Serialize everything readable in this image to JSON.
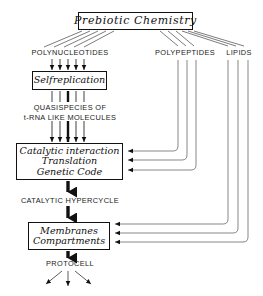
{
  "diagram": {
    "type": "flowchart",
    "boxes": [
      {
        "id": "prebiotic",
        "lines": [
          "Prebiotic  Chemistry"
        ]
      },
      {
        "id": "selfreplication",
        "lines": [
          "Selfreplication"
        ]
      },
      {
        "id": "catalytic",
        "lines": [
          "Catalytic  interaction",
          "Translation",
          "Genetic  Code"
        ]
      },
      {
        "id": "membranes",
        "lines": [
          "Membranes",
          "Compartments"
        ]
      }
    ],
    "captions": {
      "polynucleotides": "POLYNUCLEOTIDES",
      "polypeptides": "POLYPEPTIDES",
      "lipids": "LIPIDS",
      "quasispecies_line1": "QUASISPECIES   OF",
      "quasispecies_line2": "t-RNA LIKE MOLECULES",
      "hypercycle": "CATALYTIC HYPERCYCLE",
      "protocell": "PROTOCELL"
    },
    "colors": {
      "ink": "#111111",
      "paper": "#ffffff",
      "thin_line": "#444444"
    },
    "flows": [
      {
        "from": "prebiotic",
        "to": "polynucleotides",
        "style": "fan-lines",
        "count": 5
      },
      {
        "from": "polynucleotides",
        "to": "selfreplication",
        "style": "thin-arrows",
        "count": 5
      },
      {
        "from": "selfreplication",
        "to": "quasispecies",
        "style": "thin-arrows",
        "count": 5
      },
      {
        "from": "quasispecies",
        "to": "catalytic",
        "style": "thin-arrows",
        "count": 5
      },
      {
        "from": "prebiotic",
        "to": "polypeptides",
        "style": "fan-lines",
        "count": 3
      },
      {
        "from": "prebiotic",
        "to": "lipids",
        "style": "fan-lines",
        "count": 3
      },
      {
        "from": "polypeptides",
        "to": "catalytic",
        "style": "routed-arrow",
        "count": 3
      },
      {
        "from": "lipids",
        "to": "membranes",
        "style": "routed-arrow",
        "count": 3
      },
      {
        "from": "catalytic",
        "to": "hypercycle",
        "style": "thick-arrow"
      },
      {
        "from": "hypercycle",
        "to": "membranes",
        "style": "thick-arrow"
      },
      {
        "from": "membranes",
        "to": "protocell",
        "style": "thick-arrow"
      },
      {
        "from": "protocell",
        "to": "outcomes",
        "style": "thin-arrow-fan",
        "count": 3
      }
    ]
  }
}
